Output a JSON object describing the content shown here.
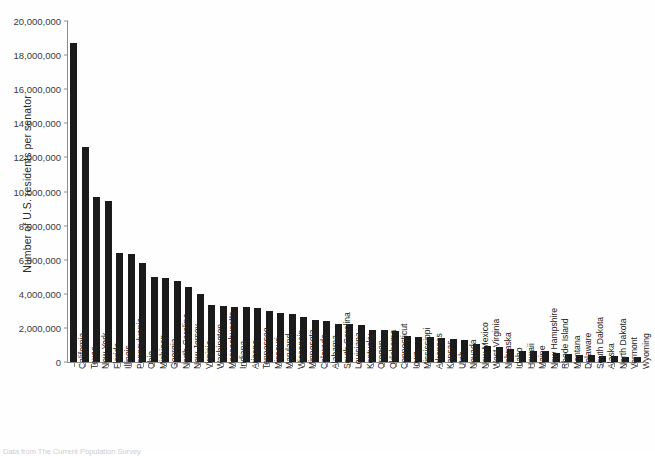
{
  "chart_data": {
    "type": "bar",
    "title": "",
    "xlabel": "",
    "ylabel": "Number of U.S. residents per senator",
    "ylim": [
      0,
      20000000
    ],
    "ytick_labels": [
      "0",
      "2,000,000",
      "4,000,000",
      "6,000,000",
      "8,000,000",
      "10,000,000",
      "12,000,000",
      "14,000,000",
      "16,000,000",
      "18,000,000",
      "20,000,000"
    ],
    "ytick_values": [
      0,
      2000000,
      4000000,
      6000000,
      8000000,
      10000000,
      12000000,
      14000000,
      16000000,
      18000000,
      20000000
    ],
    "grid": false,
    "legend": false,
    "bar_color": "#1b1b1b",
    "categories": [
      "California",
      "Texas",
      "New York",
      "Florida",
      "Illinois",
      "Pennsylvania",
      "Ohio",
      "Michigan",
      "Georgia",
      "North Carolina",
      "New Jersey",
      "Virginia",
      "Washington",
      "Massachusetts",
      "Indiana",
      "Arizona",
      "Tennessee",
      "Missouri",
      "Maryland",
      "Wisconsin",
      "Minnesota",
      "Colorado",
      "Alabama",
      "South Carolina",
      "Louisiana",
      "Kentucky",
      "Oregon",
      "Oklahoma",
      "Connecticut",
      "Iowa",
      "Mississippi",
      "Arkansas",
      "Kansas",
      "Utah",
      "Nevada",
      "New Mexico",
      "West Virginia",
      "Nebraska",
      "Idaho",
      "Hawaii",
      "Maine",
      "New Hampshire",
      "Rhode Island",
      "Montana",
      "Delaware",
      "South Dakota",
      "Alaska",
      "North Dakota",
      "Vermont",
      "Wyoming"
    ],
    "values": [
      18700000,
      12600000,
      9700000,
      9450000,
      6400000,
      6350000,
      5800000,
      5000000,
      4900000,
      4750000,
      4400000,
      4000000,
      3350000,
      3300000,
      3250000,
      3200000,
      3150000,
      3000000,
      2850000,
      2800000,
      2650000,
      2450000,
      2400000,
      2250000,
      2250000,
      2150000,
      1900000,
      1850000,
      1800000,
      1500000,
      1480000,
      1450000,
      1400000,
      1350000,
      1300000,
      1050000,
      930000,
      900000,
      750000,
      640000,
      660000,
      650000,
      530000,
      490000,
      440000,
      405000,
      355000,
      335000,
      310000,
      285000
    ]
  },
  "axis": {
    "ylabel": "Number of U.S. residents per senator"
  },
  "footer": {
    "source": "Data from The Current Population Survey"
  }
}
